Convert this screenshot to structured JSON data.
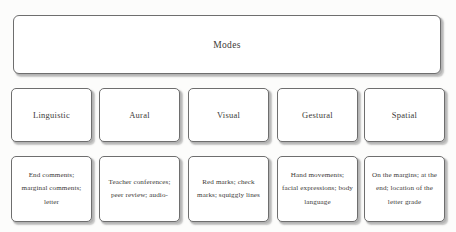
{
  "diagram": {
    "title": "Modes",
    "header": {
      "label": "Modes"
    },
    "modes": [
      {
        "label": "Linguistic"
      },
      {
        "label": "Aural"
      },
      {
        "label": "Visual"
      },
      {
        "label": "Gestural"
      },
      {
        "label": "Spatial"
      }
    ],
    "examples": [
      {
        "text": "End comments; marginal comments; letter"
      },
      {
        "text": "Teacher conferences; peer review; audio-"
      },
      {
        "text": "Red marks; check marks; squiggly lines"
      },
      {
        "text": "Hand movements; facial expressions; body language"
      },
      {
        "text": "On the margins; at the end; location of the letter grade"
      }
    ],
    "colors": {
      "background": "#fcfcfb",
      "box_fill": "#ffffff",
      "box_border": "#6e6e6e",
      "box_shadow": "#b3b3b3",
      "text": "#3c3a38"
    }
  }
}
